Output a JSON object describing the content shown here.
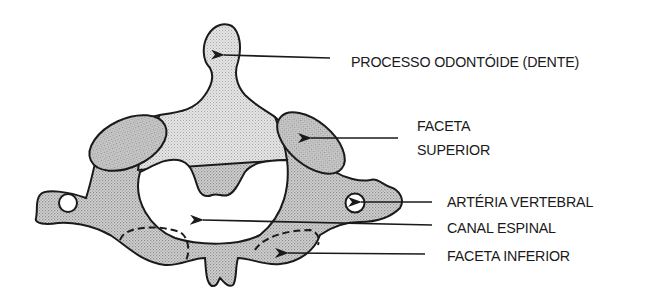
{
  "figure": {
    "labels": {
      "dens": "PROCESSO ODONTÓIDE (DENTE)",
      "superior_facet_line1": "FACETA",
      "superior_facet_line2": "SUPERIOR",
      "vertebral_artery": "ARTÉRIA VERTEBRAL",
      "spinal_canal": "CANAL ESPINAL",
      "inferior_facet": "FACETA INFERIOR"
    },
    "colors": {
      "outline": "#1a1a1a",
      "bone_fill_light": "#d6d6d6",
      "bone_fill_dark": "#c2c2c2",
      "facet_fill": "#b8b8b8",
      "canal_fill": "#ffffff",
      "text": "#1a1a1a"
    }
  }
}
